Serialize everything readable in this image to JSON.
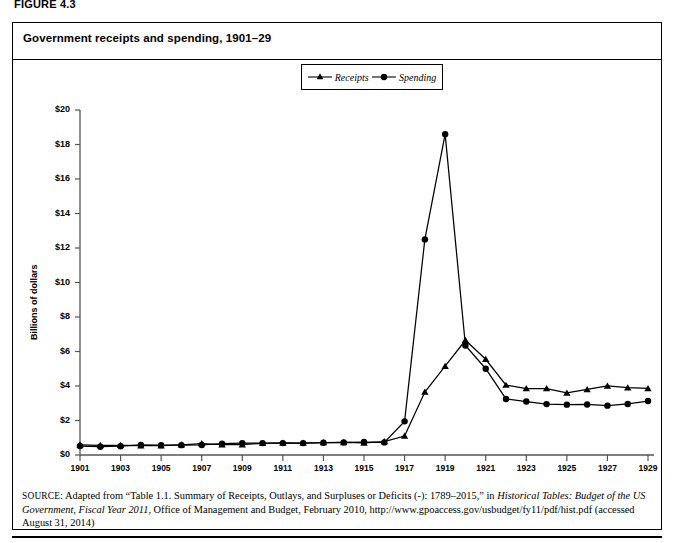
{
  "figure_label": "FIGURE 4.3",
  "chart_title": "Government receipts and spending, 1901–29",
  "legend": {
    "position": "top-center",
    "items": [
      {
        "label": "Receipts",
        "marker": "triangle-up-marker",
        "color": "#000000"
      },
      {
        "label": "Spending",
        "marker": "circle-marker",
        "color": "#000000"
      }
    ]
  },
  "source_note": {
    "prefix": "SOURCE:",
    "text_1": " Adapted from “Table 1.1. Summary of Receipts, Outlays, and Surpluses or Deficits (-): 1789–2015,” in ",
    "italic_1": "Historical Tables: Budget of the US Government, Fiscal Year 2011",
    "text_2": ", Office of Management and Budget, February 2010, http://www.gpoaccess.gov/usbudget/fy11/pdf/hist.pdf (accessed August 31, 2014)"
  },
  "chart_data": {
    "type": "line",
    "title": "Government receipts and spending, 1901–29",
    "xlabel": "",
    "ylabel": "Billions of dollars",
    "xlim": [
      1901,
      1929
    ],
    "ylim": [
      0,
      20
    ],
    "ytick_step": 2,
    "ytick_labels": [
      "$0",
      "$2",
      "$4",
      "$6",
      "$8",
      "$10",
      "$12",
      "$14",
      "$16",
      "$18",
      "$20"
    ],
    "ytick_values": [
      0,
      2,
      4,
      6,
      8,
      10,
      12,
      14,
      16,
      18,
      20
    ],
    "xtick_labels": [
      "1901",
      "1903",
      "1905",
      "1907",
      "1909",
      "1911",
      "1913",
      "1915",
      "1917",
      "1919",
      "1921",
      "1923",
      "1925",
      "1927",
      "1929"
    ],
    "xtick_values": [
      1901,
      1903,
      1905,
      1907,
      1909,
      1911,
      1913,
      1915,
      1917,
      1919,
      1921,
      1923,
      1925,
      1927,
      1929
    ],
    "grid": false,
    "x": [
      1901,
      1902,
      1903,
      1904,
      1905,
      1906,
      1907,
      1908,
      1909,
      1910,
      1911,
      1912,
      1913,
      1914,
      1915,
      1916,
      1917,
      1918,
      1919,
      1920,
      1921,
      1922,
      1923,
      1924,
      1925,
      1926,
      1927,
      1928,
      1929
    ],
    "series": [
      {
        "name": "Receipts",
        "marker": "triangle-up-marker",
        "color": "#000000",
        "values": [
          0.59,
          0.56,
          0.56,
          0.54,
          0.54,
          0.59,
          0.66,
          0.6,
          0.6,
          0.68,
          0.7,
          0.69,
          0.72,
          0.73,
          0.7,
          0.78,
          1.1,
          3.65,
          5.15,
          6.65,
          5.55,
          4.05,
          3.85,
          3.85,
          3.6,
          3.8,
          4.0,
          3.9,
          3.86
        ]
      },
      {
        "name": "Spending",
        "marker": "circle-marker",
        "color": "#000000",
        "values": [
          0.52,
          0.48,
          0.51,
          0.58,
          0.57,
          0.57,
          0.58,
          0.66,
          0.69,
          0.69,
          0.69,
          0.69,
          0.71,
          0.73,
          0.75,
          0.73,
          1.95,
          12.5,
          18.6,
          6.35,
          5.0,
          3.25,
          3.1,
          2.95,
          2.92,
          2.93,
          2.86,
          2.96,
          3.13
        ]
      }
    ]
  }
}
